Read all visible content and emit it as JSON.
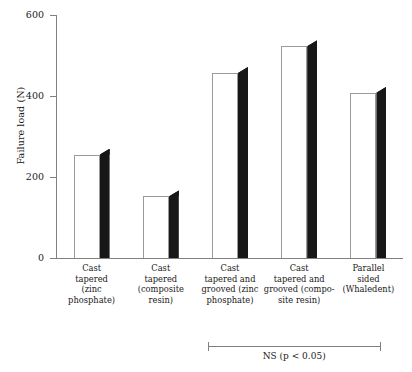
{
  "chart_data": {
    "type": "bar",
    "title": "",
    "xlabel": "",
    "ylabel": "Failure load (N)",
    "ylim": [
      0,
      600
    ],
    "yticks": [
      0,
      200,
      400,
      600
    ],
    "ytick_labels": [
      "0",
      "200",
      "400",
      "600"
    ],
    "grid": false,
    "legend": null,
    "bar_style": "3d-block-white-face-black-side",
    "categories": [
      "Cast tapered (zinc phosphate)",
      "Cast tapered (composite resin)",
      "Cast tapered and grooved (zinc phosphate)",
      "Cast tapered and grooved (composite resin)",
      "Parallel sided (Whaledent)"
    ],
    "category_lines": [
      [
        "Cast",
        "tapered",
        "(zinc",
        "phosphate)"
      ],
      [
        "Cast",
        "tapered",
        "(composite",
        "resin)"
      ],
      [
        "Cast",
        "tapered and",
        "grooved (zinc",
        "phosphate)"
      ],
      [
        "Cast",
        "tapered and",
        "grooved (compo-",
        "site resin)"
      ],
      [
        "Parallel",
        "sided",
        "(Whaledent)"
      ]
    ],
    "values": [
      255,
      152,
      457,
      523,
      408
    ],
    "annotations": [
      {
        "text": "NS (p < 0.05)",
        "type": "significance-bracket",
        "spans_categories": [
          2,
          3,
          4
        ]
      }
    ]
  },
  "colors": {
    "bar_face": "#ffffff",
    "bar_side": "#171717",
    "bar_outline": "#9a9a9a",
    "axis": "#808080",
    "text": "#1a1a1a",
    "background": "#ffffff"
  }
}
